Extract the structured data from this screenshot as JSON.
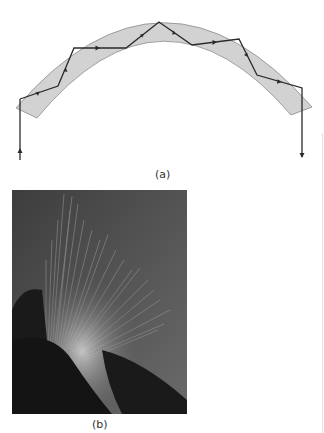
{
  "figure_a": {
    "label": "(a)",
    "description": "Light ray undergoing total internal reflection inside a curved optical fiber (arc)",
    "colors": {
      "fiber_fill": "#d2d2d2",
      "fiber_stroke": "#8a8a8a",
      "ray": "#2a2a2a"
    },
    "ray_vertices": [
      [
        20,
        160
      ],
      [
        20,
        99
      ],
      [
        58,
        86
      ],
      [
        74,
        48
      ],
      [
        126,
        48
      ],
      [
        159,
        22
      ],
      [
        192,
        45
      ],
      [
        239,
        39
      ],
      [
        257,
        75
      ],
      [
        302,
        88
      ],
      [
        302,
        158
      ]
    ]
  },
  "figure_b": {
    "label": "(b)",
    "description": "Photograph of a bundle of glowing optical fibers"
  }
}
